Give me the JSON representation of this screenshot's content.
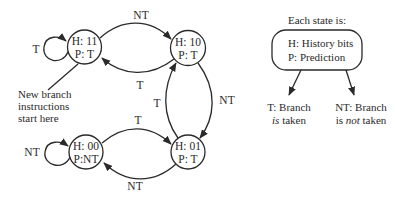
{
  "diagram": {
    "type": "state-machine",
    "stroke_color": "#2a2a2a",
    "states": [
      {
        "id": "s11",
        "history": "H: 11",
        "prediction": "P: T"
      },
      {
        "id": "s10",
        "history": "H: 10",
        "prediction": "P: T"
      },
      {
        "id": "s01",
        "history": "H: 01",
        "prediction": "P: T"
      },
      {
        "id": "s00",
        "history": "H: 00",
        "prediction": "P:NT"
      }
    ],
    "transitions": [
      {
        "from": "s11",
        "to": "s11",
        "label": "T"
      },
      {
        "from": "s11",
        "to": "s10",
        "label": "NT"
      },
      {
        "from": "s10",
        "to": "s11",
        "label": "T"
      },
      {
        "from": "s10",
        "to": "s01",
        "label": "NT"
      },
      {
        "from": "s01",
        "to": "s10",
        "label": "T"
      },
      {
        "from": "s00",
        "to": "s01",
        "label": "T"
      },
      {
        "from": "s01",
        "to": "s00",
        "label": "NT"
      },
      {
        "from": "s00",
        "to": "s00",
        "label": "NT"
      }
    ],
    "start_note": [
      "New branch",
      "instructions",
      "start here"
    ]
  },
  "legend": {
    "heading": "Each state is:",
    "box_lines": [
      "H: History bits",
      "P: Prediction"
    ],
    "taken": {
      "prefix": "T: Branch",
      "emph": "is",
      "suffix": " taken"
    },
    "not_taken": {
      "prefix": "NT: Branch",
      "line2_pre": "is ",
      "emph": "not",
      "suffix": " taken"
    }
  }
}
